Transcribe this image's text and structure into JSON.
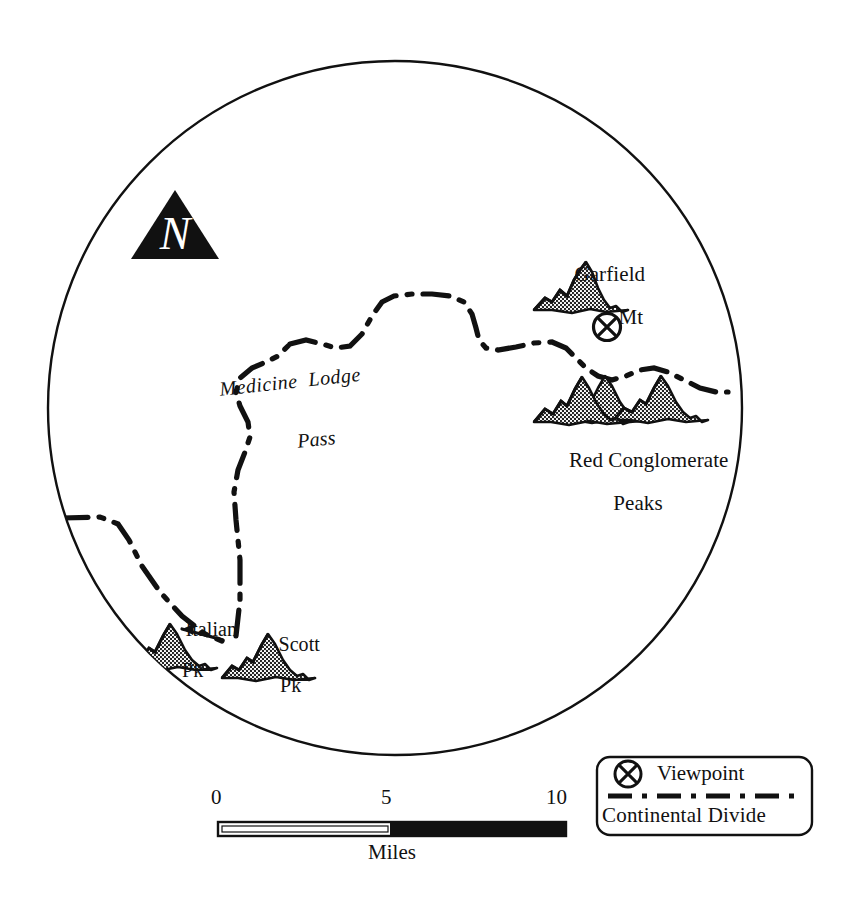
{
  "map": {
    "title": "Continental Divide viewshed map",
    "shape": "circular-vignette",
    "background_color": "#ffffff",
    "ink_color": "#111111",
    "circle": {
      "cx": 395,
      "cy": 408,
      "r": 347
    },
    "north_arrow": {
      "name": "north-arrow",
      "letter": "N",
      "style": "black triangle with white script N"
    },
    "features": [
      {
        "id": "garfield-mt",
        "kind": "mountain-symbol",
        "label_line1": "Garfield",
        "label_line2": "Mt",
        "peaks": 1
      },
      {
        "id": "red-conglomerate-peaks",
        "kind": "mountain-symbol",
        "label_line1": "Red Conglomerate",
        "label_line2": "Peaks",
        "peaks": 3
      },
      {
        "id": "italian-pk",
        "kind": "mountain-symbol",
        "label_line1": "Italian",
        "label_line2": "Pk",
        "peaks": 1,
        "has_leader_line": true
      },
      {
        "id": "scott-pk",
        "kind": "mountain-symbol",
        "label_line1": "Scott",
        "label_line2": "Pk",
        "peaks": 1
      },
      {
        "id": "medicine-lodge-pass",
        "kind": "pass-label",
        "label_line1": "Medicine  Lodge",
        "label_line2": "Pass",
        "style": "italic"
      }
    ],
    "viewpoint_marker": {
      "name": "viewpoint-marker",
      "glyph": "circled-x",
      "x": 607,
      "y": 327
    }
  },
  "scale_bar": {
    "name": "scale-bar",
    "ticks": [
      "0",
      "5",
      "10"
    ],
    "unit": "Miles",
    "min": 0,
    "max": 10,
    "midpoint": 5
  },
  "legend": {
    "name": "map-legend",
    "items": [
      {
        "icon": "circled-x-icon",
        "label": "Viewpoint"
      },
      {
        "icon": "dash-dot-line-icon",
        "label": "Continental Divide"
      }
    ]
  }
}
